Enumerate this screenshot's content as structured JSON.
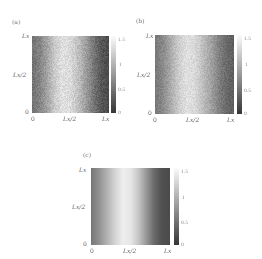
{
  "chart_data": [
    {
      "type": "heatmap",
      "panel_label": "(a)",
      "title": "",
      "xlabel": "",
      "ylabel": "",
      "x_ticks": [
        "0",
        "L_x/2",
        "L_x"
      ],
      "y_ticks": [
        "0",
        "L_x/2",
        "L_x"
      ],
      "x_tick_display": [
        "0",
        "Lx/2",
        "Lx"
      ],
      "y_tick_display": [
        "0",
        "Lx/2",
        "Lx"
      ],
      "colorbar": {
        "ticks": [
          "0",
          "0.5",
          "1",
          "1.5"
        ],
        "range": [
          0,
          1.5
        ],
        "colormap": "gray"
      },
      "pattern": "noisy, varies along x only; dark at x=0 (~0.4), bright near x≈0.4 Lx (~1.3), dark at x=Lx (~0.1)",
      "profile_x": [
        0.0,
        0.1,
        0.2,
        0.3,
        0.4,
        0.5,
        0.6,
        0.7,
        0.8,
        0.9,
        1.0
      ],
      "profile_values": [
        0.45,
        0.6,
        0.85,
        1.15,
        1.3,
        1.25,
        1.05,
        0.8,
        0.5,
        0.25,
        0.15
      ],
      "noise": 0.12
    },
    {
      "type": "heatmap",
      "panel_label": "(b)",
      "title": "",
      "xlabel": "",
      "ylabel": "",
      "x_ticks": [
        "0",
        "L_x/2",
        "L_x"
      ],
      "y_ticks": [
        "0",
        "L_x/2",
        "L_x"
      ],
      "x_tick_display": [
        "0",
        "Lx/2",
        "Lx"
      ],
      "y_tick_display": [
        "0",
        "Lx/2",
        "Lx"
      ],
      "colorbar": {
        "ticks": [
          "0",
          "0.5",
          "1",
          "1.5"
        ],
        "range": [
          0,
          1.5
        ],
        "colormap": "gray"
      },
      "pattern": "noisy, varies along x only; bright band near x≈0.4 Lx",
      "profile_x": [
        0.0,
        0.1,
        0.2,
        0.3,
        0.4,
        0.5,
        0.6,
        0.7,
        0.8,
        0.9,
        1.0
      ],
      "profile_values": [
        0.5,
        0.65,
        0.9,
        1.15,
        1.3,
        1.25,
        1.05,
        0.85,
        0.6,
        0.4,
        0.3
      ],
      "noise": 0.1
    },
    {
      "type": "heatmap",
      "panel_label": "(c)",
      "title": "",
      "xlabel": "",
      "ylabel": "",
      "x_ticks": [
        "0",
        "L_x/2",
        "L_x"
      ],
      "y_ticks": [
        "0",
        "L_x/2",
        "L_x"
      ],
      "x_tick_display": [
        "0",
        "Lx/2",
        "Lx"
      ],
      "y_tick_display": [
        "0",
        "Lx/2",
        "Lx"
      ],
      "colorbar": {
        "ticks": [
          "0",
          "0.5",
          "1",
          "1.5"
        ],
        "range": [
          0,
          1.5
        ],
        "colormap": "gray"
      },
      "pattern": "smooth, varies along x only; bright band near x≈0.45 Lx, dark at x=Lx",
      "profile_x": [
        0.0,
        0.1,
        0.2,
        0.3,
        0.4,
        0.5,
        0.6,
        0.7,
        0.8,
        0.9,
        1.0
      ],
      "profile_values": [
        0.5,
        0.7,
        0.95,
        1.2,
        1.4,
        1.35,
        1.1,
        0.75,
        0.4,
        0.2,
        0.15
      ],
      "noise": 0.0
    }
  ]
}
